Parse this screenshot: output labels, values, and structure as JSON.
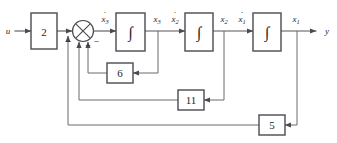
{
  "diagram": {
    "type": "control-system-block-diagram",
    "input": {
      "label": "u"
    },
    "output": {
      "label": "y"
    },
    "forward_path": {
      "input_gain": {
        "label": "2",
        "name": "input-gain-block"
      },
      "summing_junction": {
        "name": "summing-junction",
        "symbol": "crossed-circle",
        "signs": [
          "−",
          "−",
          "−"
        ],
        "sign_left": "−",
        "sign_right": "−",
        "sign_bottom": "−"
      },
      "integrators": [
        {
          "label": "∫",
          "name": "integrator-1",
          "input_signal": "ẋ3",
          "output_signal": "x3"
        },
        {
          "label": "∫",
          "name": "integrator-2",
          "input_signal": "ẋ2",
          "output_signal": "x2"
        },
        {
          "label": "∫",
          "name": "integrator-3",
          "input_signal": "ẋ1",
          "output_signal": "x1"
        }
      ]
    },
    "signals": {
      "x3dot_base": "x",
      "x3dot_sub": "3",
      "x3_base": "x",
      "x3_sub": "3",
      "x2dot_base": "x",
      "x2dot_sub": "2",
      "x2_base": "x",
      "x2_sub": "2",
      "x1dot_base": "x",
      "x1dot_sub": "1",
      "x1_base": "x",
      "x1_sub": "1"
    },
    "feedback_gains": [
      {
        "label": "6",
        "name": "feedback-gain-6",
        "from_signal": "x3",
        "to": "summing-junction"
      },
      {
        "label": "11",
        "name": "feedback-gain-11",
        "from_signal": "x2",
        "to": "summing-junction"
      },
      {
        "label": "5",
        "name": "feedback-gain-5",
        "from_signal": "x1",
        "to": "summing-junction"
      }
    ],
    "colors": {
      "line": "#54545a",
      "box_stroke": "#4a4a50",
      "text": "#26262b",
      "background": "#ffffff"
    }
  }
}
